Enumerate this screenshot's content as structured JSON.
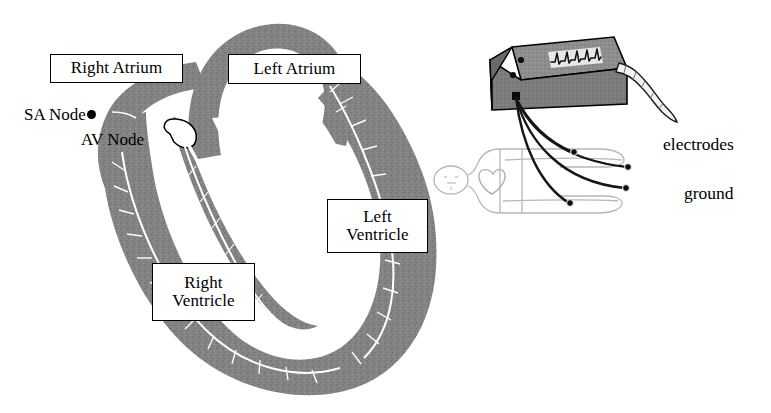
{
  "figure": {
    "background_color": "#ffffff",
    "ink_color": "#000000",
    "tissue_color": "#808080",
    "tissue_shadow_color": "#6e6e6e",
    "conduction_path_color": "#ffffff",
    "body_outline_color": "#b5b5b5",
    "lead_wire_color": "#1a1a1a"
  },
  "heart_diagram": {
    "boxed_labels": [
      {
        "id": "right-atrium",
        "lines": [
          "Right Atrium"
        ]
      },
      {
        "id": "left-atrium",
        "lines": [
          "Left Atrium"
        ]
      },
      {
        "id": "left-ventricle",
        "lines": [
          "Left",
          "Ventricle"
        ]
      },
      {
        "id": "right-ventricle",
        "lines": [
          "Right",
          "Ventricle"
        ]
      }
    ],
    "node_labels": [
      {
        "id": "sa-node",
        "text": "SA Node",
        "marker": "filled-dot"
      },
      {
        "id": "av-node",
        "text": "AV Node",
        "marker": "open-loop"
      }
    ]
  },
  "ecg_setup": {
    "machine": {
      "name": "ecg-machine",
      "has_knobs": true,
      "knob_count": 2,
      "display_trace": "ecg-waveform",
      "paper_strip": "printout-strip",
      "lead_connector": "lead-connector-port"
    },
    "patient": {
      "name": "patient-figure",
      "posture": "supine",
      "heart_marker": "heart-shape"
    },
    "leads": {
      "count": 4,
      "electrode_count": 3,
      "ground_count": 1
    },
    "labels": {
      "electrodes": "electrodes",
      "ground": "ground"
    }
  }
}
